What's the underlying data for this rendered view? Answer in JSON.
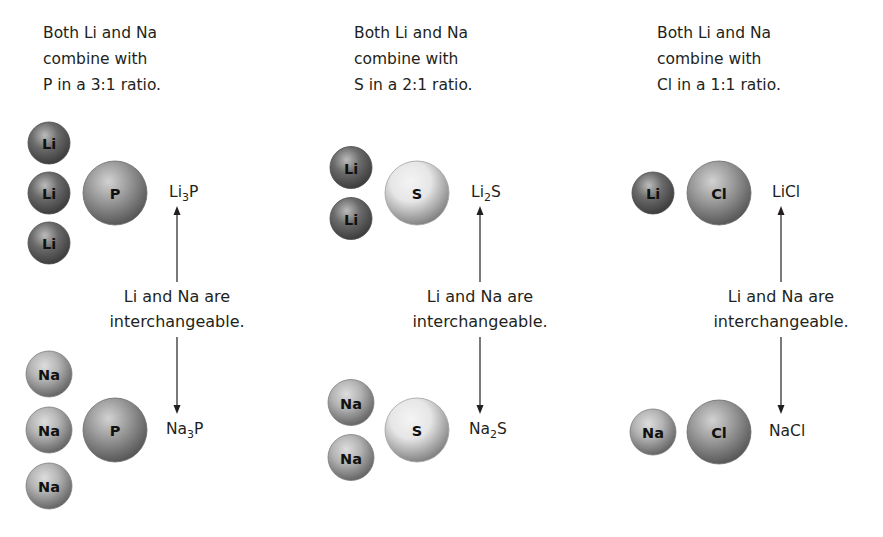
{
  "panels": [
    {
      "caption": [
        "Both Li and Na",
        "combine with",
        "P in a 3:1 ratio."
      ],
      "partner": "P",
      "ratio": "3:1",
      "top": {
        "metal": "Li",
        "count": 3,
        "formula_base": "Li",
        "formula_sub": "3",
        "formula_tail": "P"
      },
      "bottom": {
        "metal": "Na",
        "count": 3,
        "formula_base": "Na",
        "formula_sub": "3",
        "formula_tail": "P"
      },
      "middle": [
        "Li and Na are",
        "interchangeable."
      ]
    },
    {
      "caption": [
        "Both Li and Na",
        "combine with",
        "S in a 2:1 ratio."
      ],
      "partner": "S",
      "ratio": "2:1",
      "top": {
        "metal": "Li",
        "count": 2,
        "formula_base": "Li",
        "formula_sub": "2",
        "formula_tail": "S"
      },
      "bottom": {
        "metal": "Na",
        "count": 2,
        "formula_base": "Na",
        "formula_sub": "2",
        "formula_tail": "S"
      },
      "middle": [
        "Li and Na are",
        "interchangeable."
      ]
    },
    {
      "caption": [
        "Both Li and Na",
        "combine with",
        "Cl in a 1:1 ratio."
      ],
      "partner": "Cl",
      "ratio": "1:1",
      "top": {
        "metal": "Li",
        "count": 1,
        "formula_base": "LiCl",
        "formula_sub": "",
        "formula_tail": ""
      },
      "bottom": {
        "metal": "Na",
        "count": 1,
        "formula_base": "NaCl",
        "formula_sub": "",
        "formula_tail": ""
      },
      "middle": [
        "Li and Na are",
        "interchangeable."
      ]
    }
  ],
  "colors": {
    "Li": "#6b6b6b",
    "Na": "#b3b3b3",
    "P": "#9a9a9a",
    "S": "#e6e6e6",
    "Cl": "#9c9c9c",
    "arrow": "#231f20"
  }
}
